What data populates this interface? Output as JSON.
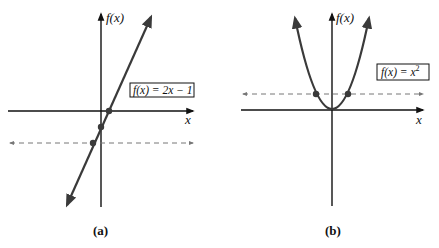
{
  "panels": [
    {
      "id": "a",
      "caption": "(a)",
      "function_label": "f(x) = 2x − 1",
      "y_axis_label": "f(x)",
      "x_axis_label": "x"
    },
    {
      "id": "b",
      "caption": "(b)",
      "function_label_base": "f(x) = x",
      "function_label_exp": "2",
      "y_axis_label": "f(x)",
      "x_axis_label": "x"
    }
  ],
  "colors": {
    "curve": "#3a3a3a",
    "axis": "#111111",
    "dashed": "#777777",
    "point": "#3a3a3a"
  }
}
